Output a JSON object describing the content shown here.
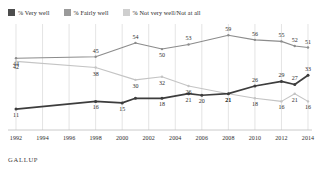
{
  "legend": {
    "items": [
      {
        "label": "% Very well",
        "color": "#4d4d4d",
        "name": "legend-very-well"
      },
      {
        "label": "% Fairly well",
        "color": "#9a9a9a",
        "name": "legend-fairly-well"
      },
      {
        "label": "% Not very well/Not at all",
        "color": "#cccccc",
        "name": "legend-not-very-well"
      }
    ]
  },
  "source": {
    "label": "GALLUP"
  },
  "chart_data": {
    "type": "line",
    "title": "",
    "xlabel": "",
    "ylabel": "",
    "grid": true,
    "legend_position": "top-left",
    "ylim": [
      0,
      65
    ],
    "xlim": [
      1992,
      2014
    ],
    "x": [
      1992,
      1998,
      2001,
      2003,
      2005,
      2008,
      2010,
      2012,
      2013,
      2014
    ],
    "xticks": [
      "1992",
      "1994",
      "1996",
      "1998",
      "2000",
      "2002",
      "2004",
      "2006",
      "2008",
      "2010",
      "2012",
      "2014"
    ],
    "series": [
      {
        "name": "% Fairly well",
        "color": "#8c8c8c",
        "x": [
          1992,
          1998,
          2001,
          2003,
          2005,
          2008,
          2010,
          2012,
          2013,
          2014
        ],
        "values": [
          44,
          45,
          54,
          50,
          53,
          59,
          56,
          55,
          52,
          51
        ],
        "labels": [
          "44",
          "45",
          "54",
          "50",
          "53",
          "59",
          "56",
          "55",
          "52",
          "51"
        ]
      },
      {
        "name": "% Very well",
        "color": "#c4c4c4",
        "x": [
          1992,
          1998,
          2001,
          2003,
          2005,
          2008,
          2010,
          2012,
          2013,
          2014
        ],
        "values": [
          42,
          38,
          30,
          32,
          26,
          21,
          18,
          16,
          21,
          16
        ],
        "labels": [
          "42",
          "38",
          "30",
          "32",
          "26",
          "21",
          "18",
          "16",
          "21",
          "16"
        ]
      },
      {
        "name": "% Not very well/Not at all",
        "color": "#3d3d3d",
        "x": [
          1992,
          1998,
          2000,
          2001,
          2003,
          2005,
          2006,
          2008,
          2010,
          2012,
          2013,
          2014
        ],
        "values": [
          11,
          16,
          15,
          18,
          18,
          21,
          20,
          21,
          26,
          29,
          27,
          33
        ],
        "labels": [
          "11",
          "16",
          "15",
          "",
          "18",
          "21",
          "20",
          "21",
          "26",
          "29",
          "27",
          "33"
        ]
      }
    ]
  }
}
